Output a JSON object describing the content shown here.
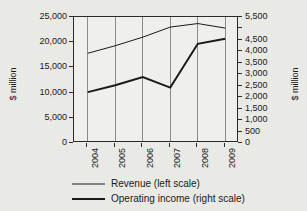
{
  "chart_data": {
    "type": "line",
    "title": "",
    "xlabel": "",
    "ylabel": "$ million",
    "ylabel_right": "$ million",
    "grid": "vertical",
    "legend_position": "bottom",
    "categories": [
      "2004",
      "2005",
      "2006",
      "2007",
      "2008",
      "2009"
    ],
    "ylim": [
      0,
      25000
    ],
    "ylim_right": [
      0,
      5500
    ],
    "yticks": [
      0,
      5000,
      10000,
      15000,
      20000,
      25000
    ],
    "ytick_labels": [
      "0",
      "5,000",
      "10,000",
      "15,000",
      "20,000",
      "25,000"
    ],
    "yticks_right": [
      0,
      500,
      1000,
      1500,
      2000,
      2500,
      3000,
      3500,
      4000,
      4500,
      5000,
      5500
    ],
    "ytick_labels_right": [
      "0",
      "500",
      "1,000",
      "1,500",
      "2,000",
      "2,500",
      "3,000",
      "3,500",
      "4,000",
      "4,500",
      "",
      "5,500"
    ],
    "series": [
      {
        "name": "Revenue (left scale)",
        "axis": "left",
        "line_width": 1,
        "color": "#1a1a1a",
        "values": [
          17800,
          19300,
          21000,
          23000,
          23700,
          22800
        ]
      },
      {
        "name": "Operating income (right scale)",
        "axis": "right",
        "line_width": 2,
        "color": "#1a1a1a",
        "values": [
          2220,
          2520,
          2880,
          2420,
          4330,
          4550
        ]
      }
    ]
  },
  "legend": {
    "items": [
      {
        "label": "Revenue (left scale)"
      },
      {
        "label": "Operating income (right scale)"
      }
    ]
  },
  "colors": {
    "background": "#e9e9e6",
    "plot_background": "#efefec",
    "axis": "#2b2b2b",
    "gridline": "#8b8b8b",
    "text": "#1a1a1a"
  }
}
